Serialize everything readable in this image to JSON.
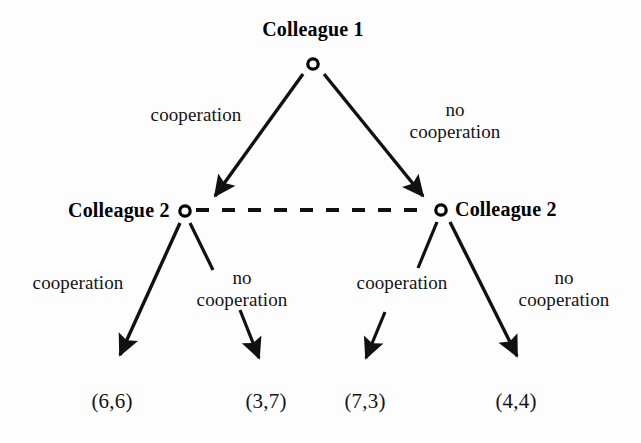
{
  "diagram": {
    "type": "extensive-form-game-tree",
    "title_node": "Colleague 1",
    "players": {
      "root": "Colleague 1",
      "left_second": "Colleague 2",
      "right_second": "Colleague 2"
    },
    "colors": {
      "line": "#111111",
      "text": "#141414",
      "background": "#fdfdfd",
      "node_stroke": "#000000"
    },
    "edge_labels": {
      "root_left": "cooperation",
      "root_right_line1": "no",
      "root_right_line2": "cooperation",
      "left_left": "cooperation",
      "left_right_line1": "no",
      "left_right_line2": "cooperation",
      "right_left": "cooperation",
      "right_right_line1": "no",
      "right_right_line2": "cooperation"
    },
    "payoffs": [
      {
        "id": "outcome-1",
        "text": "(6,6)",
        "player1": 6,
        "player2": 6
      },
      {
        "id": "outcome-2",
        "text": "(3,7)",
        "player1": 3,
        "player2": 7
      },
      {
        "id": "outcome-3",
        "text": "(7,3)",
        "player1": 7,
        "player2": 3
      },
      {
        "id": "outcome-4",
        "text": "(4,4)",
        "player1": 4,
        "player2": 4
      }
    ],
    "information_set": {
      "style": "dashed",
      "connects": [
        "left_second",
        "right_second"
      ]
    }
  }
}
